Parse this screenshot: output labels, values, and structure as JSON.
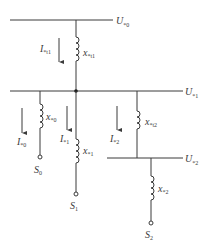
{
  "diagram": {
    "title": "",
    "buses": [
      {
        "id": "U0",
        "main": "U",
        "sub": "*0"
      },
      {
        "id": "U1",
        "main": "U",
        "sub": "*1"
      },
      {
        "id": "U2",
        "main": "U",
        "sub": "*2"
      }
    ],
    "reactances": [
      {
        "id": "xt1",
        "main": "x",
        "sub": "*t1"
      },
      {
        "id": "x0",
        "main": "x",
        "sub": "*0"
      },
      {
        "id": "x1",
        "main": "x",
        "sub": "*1"
      },
      {
        "id": "xt2",
        "main": "x",
        "sub": "*t2"
      },
      {
        "id": "x2",
        "main": "x",
        "sub": "*2"
      }
    ],
    "currents": [
      {
        "id": "It1",
        "main": "I",
        "sub": "*t1"
      },
      {
        "id": "I0",
        "main": "I",
        "sub": "*0"
      },
      {
        "id": "I1",
        "main": "I",
        "sub": "*1"
      },
      {
        "id": "I2",
        "main": "I",
        "sub": "*2"
      }
    ],
    "sources": [
      {
        "id": "S0",
        "main": "S",
        "sub": "0"
      },
      {
        "id": "S1",
        "main": "S",
        "sub": "1"
      },
      {
        "id": "S2",
        "main": "S",
        "sub": "2"
      }
    ],
    "colors": {
      "line": "#3a3a3a",
      "background": "#ffffff"
    }
  }
}
